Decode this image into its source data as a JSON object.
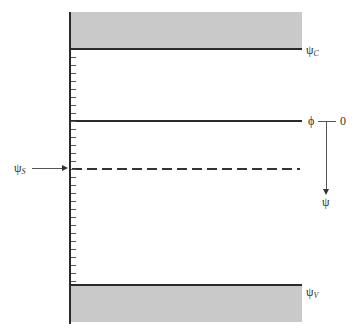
{
  "diagram": {
    "type": "energy-level / potential diagram",
    "levels": {
      "conduction": {
        "symbol": "ψ",
        "subscript": "C"
      },
      "fermi": {
        "symbol": "ϕ",
        "reference": "0"
      },
      "surface": {
        "symbol": "ψ",
        "subscript": "S",
        "style": "dashed"
      },
      "valence": {
        "symbol": "ψ",
        "subscript": "V"
      }
    },
    "axis_arrow": {
      "label": "ψ",
      "direction": "down"
    },
    "tick_count": 28,
    "colors": {
      "band_fill": "#c9c9c9",
      "line": "#2a2a2a"
    }
  }
}
